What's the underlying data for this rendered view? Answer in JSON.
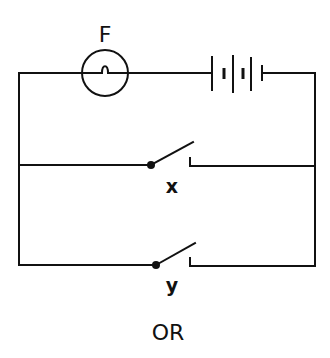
{
  "diagram": {
    "type": "circuit",
    "components": {
      "lamp": {
        "label": "F",
        "symbol": "filament-lamp"
      },
      "battery": {
        "symbol": "battery",
        "cells": 3
      },
      "switch_x": {
        "label": "x",
        "symbol": "open-switch"
      },
      "switch_y": {
        "label": "y",
        "symbol": "open-switch"
      }
    },
    "caption": "OR",
    "colors": {
      "line": "#111111",
      "background": "#ffffff"
    }
  }
}
